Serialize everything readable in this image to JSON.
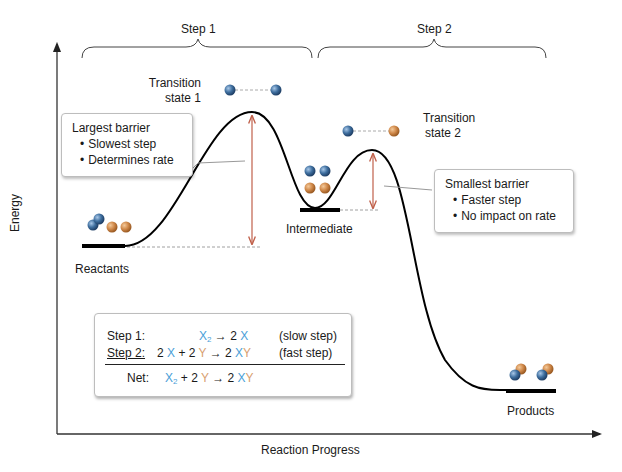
{
  "diagram": {
    "type": "reaction-energy-profile",
    "axes": {
      "y_label": "Energy",
      "x_label": "Reaction Progress"
    },
    "steps": [
      {
        "label": "Step 1"
      },
      {
        "label": "Step 2"
      }
    ],
    "states": {
      "reactants": "Reactants",
      "transition_state_1": [
        "Transition",
        "state 1"
      ],
      "intermediate": "Intermediate",
      "transition_state_2": [
        "Transition",
        "state 2"
      ],
      "products": "Products"
    },
    "callouts": {
      "largest_barrier": {
        "title": "Largest barrier",
        "bullets": [
          "Slowest step",
          "Determines rate"
        ]
      },
      "smallest_barrier": {
        "title": "Smallest barrier",
        "bullets": [
          "Faster step",
          "No impact on rate"
        ]
      }
    },
    "equations": {
      "step1": {
        "label": "Step 1:",
        "lhs_species": "X",
        "lhs_sub": "2",
        "arrow": "→",
        "rhs_coef": "2",
        "rhs_species": "X",
        "note": "(slow step)"
      },
      "step2": {
        "label": "Step 2:",
        "coef_x": "2",
        "species_x": "X",
        "plus": "+",
        "coef_y": "2",
        "species_y": "Y",
        "arrow": "→",
        "rhs_coef": "2",
        "rhs_x": "X",
        "rhs_y": "Y",
        "note": "(fast step)"
      },
      "net": {
        "label": "Net:",
        "lhs_species": "X",
        "lhs_sub": "2",
        "plus": "+",
        "coef_y": "2",
        "species_y": "Y",
        "arrow": "→",
        "rhs_coef": "2",
        "rhs_x": "X",
        "rhs_y": "Y"
      }
    },
    "colors": {
      "curve": "#000000",
      "barrier_arrow": "#c0604a",
      "atom_x": "#3a6ea5",
      "atom_y": "#d0894a",
      "text_x": "#4aa0d8",
      "text_y": "#d8a070"
    }
  }
}
